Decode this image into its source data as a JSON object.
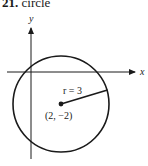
{
  "title": {
    "number": "21.",
    "label": "circle"
  },
  "diagram": {
    "axes": {
      "x_label": "x",
      "y_label": "y"
    },
    "circle": {
      "center_label": "(2, −2)",
      "radius_label": "r = 3",
      "center": [
        2,
        -2
      ],
      "radius": 3
    },
    "colors": {
      "stroke": "#1a1a1a",
      "background": "#ffffff"
    }
  }
}
